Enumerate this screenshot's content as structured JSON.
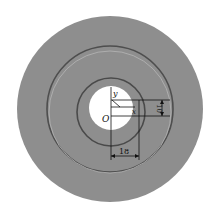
{
  "diagram": {
    "colors": {
      "disc": "#8c8c8c",
      "dark_ring": "#4a4a4a",
      "light_ring": "#b8b8b8",
      "hole": "#ffffff",
      "line": "#111111"
    },
    "labels": {
      "y_axis": "y",
      "x_axis": "x",
      "origin": "O",
      "height_dim": "10",
      "width_dim": "18"
    }
  }
}
